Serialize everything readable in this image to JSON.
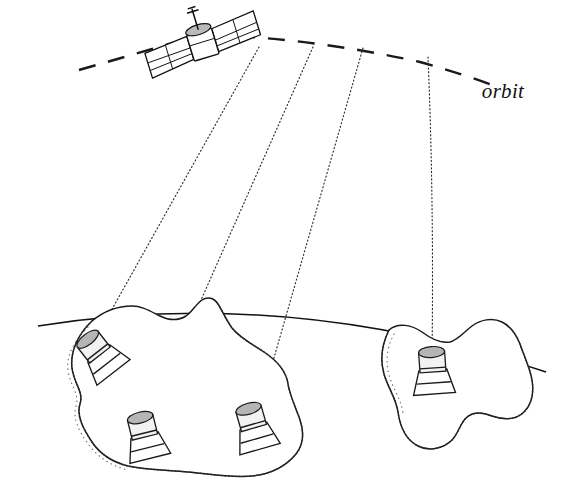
{
  "diagram": {
    "style": "hand-drawn line illustration",
    "background_color": "#ffffff",
    "ink_color": "#1a1a1a",
    "labels": {
      "orbit": "orbit"
    },
    "satellite": {
      "name": "satellite-icon",
      "position": [
        203,
        45
      ],
      "rotation_deg": -17,
      "parts": {
        "left_wing": "solar-panel-left",
        "right_wing": "solar-panel-right",
        "body": "satellite-body",
        "antenna": "antenna-mast",
        "dish": "antenna-dish"
      }
    },
    "orbit_track": {
      "name": "orbit-dashed-path",
      "stroke_dasharray": "17 13",
      "stroke_width": 2.4,
      "color": "#1a1a1a"
    },
    "beams": [
      {
        "name": "downlink-beam-1",
        "target_station": 1,
        "from": [
          258,
          48
        ],
        "to": [
          88,
          352
        ]
      },
      {
        "name": "downlink-beam-2",
        "target_station": 2,
        "from": [
          312,
          48
        ],
        "to": [
          143,
          430
        ]
      },
      {
        "name": "downlink-beam-3",
        "target_station": 3,
        "from": [
          362,
          48
        ],
        "to": [
          256,
          418
        ]
      },
      {
        "name": "downlink-beam-4",
        "target_station": 4,
        "from": [
          428,
          56
        ],
        "to": [
          432,
          358
        ]
      }
    ],
    "beam_style": {
      "stroke_dasharray": "1.1 2.6",
      "stroke_width": 1.15,
      "color": "#2b2b2b"
    },
    "horizon": {
      "name": "planet-horizon-arc",
      "description": "gentle convex arc representing the curved planetary surface",
      "color": "#111111"
    },
    "landmasses": [
      {
        "name": "landmass-left",
        "description": "large irregular island with stippled coastline",
        "station_count": 3
      },
      {
        "name": "landmass-right",
        "description": "smaller irregular island with stippled coastline",
        "station_count": 1
      }
    ],
    "ground_stations": [
      {
        "id": 1,
        "name": "ground-station-1",
        "position": [
          100,
          355
        ],
        "tilt_deg": -38,
        "landmass": "left"
      },
      {
        "id": 2,
        "name": "ground-station-2",
        "position": [
          145,
          437
        ],
        "tilt_deg": -14,
        "landmass": "left"
      },
      {
        "id": 3,
        "name": "ground-station-3",
        "position": [
          254,
          428
        ],
        "tilt_deg": -16,
        "landmass": "left"
      },
      {
        "id": 4,
        "name": "ground-station-4",
        "position": [
          433,
          372
        ],
        "tilt_deg": -4,
        "landmass": "right"
      }
    ],
    "station_parts": {
      "dish": "parabolic-dish",
      "drum": "dish-housing",
      "base": "station-pedestal"
    },
    "counts": {
      "satellites": 1,
      "beams": 4,
      "ground_stations": 4,
      "landmasses": 2
    }
  }
}
